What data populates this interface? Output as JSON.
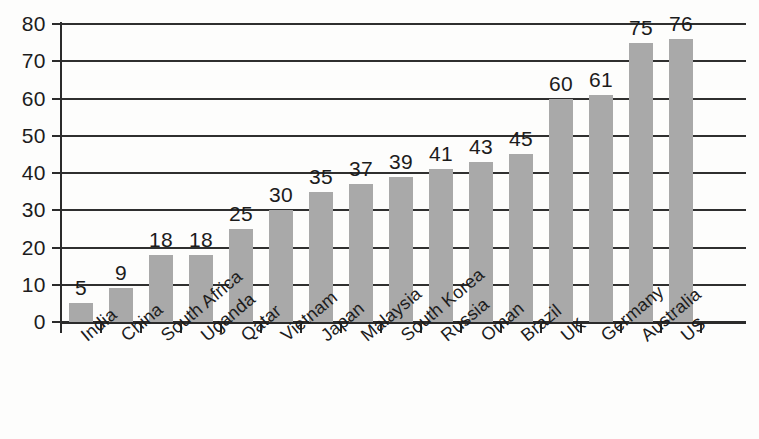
{
  "chart_data": {
    "type": "bar",
    "title": "",
    "subtitle": "",
    "xlabel": "",
    "ylabel": "",
    "ylim": [
      0,
      80
    ],
    "ytick_step": 10,
    "grid": true,
    "legend": "none",
    "orientation": "vertical",
    "value_labels": true,
    "categories": [
      "India",
      "China",
      "South Africa",
      "Uganda",
      "Qatar",
      "Vietnam",
      "Japan",
      "Malaysia",
      "South Korea",
      "Russia",
      "Oman",
      "Brazil",
      "UK",
      "Germany",
      "Australia",
      "US"
    ],
    "values": [
      5,
      9,
      18,
      18,
      25,
      30,
      35,
      37,
      39,
      41,
      43,
      45,
      60,
      61,
      75,
      76
    ],
    "ytick_labels": [
      "0",
      "10",
      "20",
      "30",
      "40",
      "50",
      "60",
      "70",
      "80"
    ],
    "ytick_values": [
      0,
      10,
      20,
      30,
      40,
      50,
      60,
      70,
      80
    ]
  },
  "style": {
    "bar_color": "#a9a9a9",
    "axis_color": "#2b2b2b",
    "grid_color": "#2f2f2f",
    "text_color": "#1c1c1c",
    "background": "#fdfdfc"
  }
}
